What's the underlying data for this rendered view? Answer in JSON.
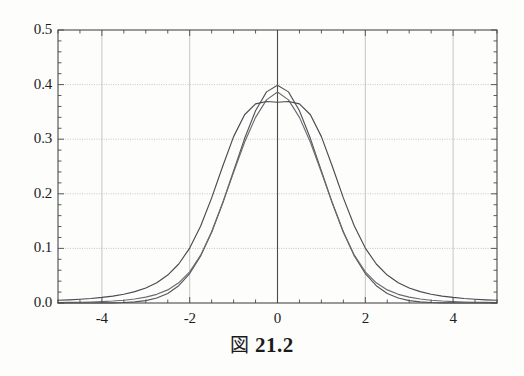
{
  "caption": {
    "figure_word": "図",
    "number": "21.2"
  },
  "chart_data": {
    "type": "line",
    "title": "",
    "xlabel": "",
    "ylabel": "",
    "xlim": [
      -5,
      5
    ],
    "ylim": [
      0.0,
      0.5
    ],
    "grid": true,
    "legend_position": "none",
    "x_ticks": [
      -4,
      -2,
      0,
      2,
      4
    ],
    "x_tick_labels": [
      "-4",
      "-2",
      "0",
      "2",
      "4"
    ],
    "x_minor_tick_step": 0.5,
    "y_ticks": [
      0.0,
      0.1,
      0.2,
      0.3,
      0.4,
      0.5
    ],
    "y_tick_labels": [
      "0.0",
      "0.1",
      "0.2",
      "0.3",
      "0.4",
      "0.5"
    ],
    "y_minor_tick_step": 0.02,
    "x": [
      -5.0,
      -4.75,
      -4.5,
      -4.25,
      -4.0,
      -3.75,
      -3.5,
      -3.25,
      -3.0,
      -2.75,
      -2.5,
      -2.25,
      -2.0,
      -1.75,
      -1.5,
      -1.25,
      -1.0,
      -0.75,
      -0.5,
      -0.25,
      0.0,
      0.25,
      0.5,
      0.75,
      1.0,
      1.25,
      1.5,
      1.75,
      2.0,
      2.25,
      2.5,
      2.75,
      3.0,
      3.25,
      3.5,
      3.75,
      4.0,
      4.25,
      4.5,
      4.75,
      5.0
    ],
    "series": [
      {
        "name": "normal",
        "peak": 0.3989,
        "color": "#55555a",
        "values": [
          1.5e-06,
          5e-06,
          1.6e-05,
          4.65e-05,
          0.0001338,
          0.0003458,
          0.0008727,
          0.00203,
          0.0044318,
          0.0090936,
          0.0175283,
          0.031682,
          0.053991,
          0.0862773,
          0.1295176,
          0.1826491,
          0.2419707,
          0.3011374,
          0.3520653,
          0.3866681,
          0.3989423,
          0.3866681,
          0.3520653,
          0.3011374,
          0.2419707,
          0.1826491,
          0.1295176,
          0.0862773,
          0.053991,
          0.031682,
          0.0175283,
          0.0090936,
          0.0044318,
          0.00203,
          0.0008727,
          0.0003458,
          0.0001338,
          4.65e-05,
          1.6e-05,
          5e-06,
          1.5e-06
        ]
      },
      {
        "name": "t-distribution-high-df",
        "peak": 0.3866,
        "color": "#6a6a70",
        "values": [
          0.0008,
          0.00105,
          0.0014,
          0.0019,
          0.0026,
          0.0036,
          0.0051,
          0.0073,
          0.0107,
          0.0159,
          0.024,
          0.0369,
          0.057,
          0.0876,
          0.1305,
          0.183,
          0.2395,
          0.2945,
          0.34,
          0.372,
          0.3866,
          0.372,
          0.34,
          0.2945,
          0.2395,
          0.183,
          0.1305,
          0.0876,
          0.057,
          0.0369,
          0.024,
          0.0159,
          0.0107,
          0.0073,
          0.0051,
          0.0036,
          0.0026,
          0.0019,
          0.0014,
          0.00105,
          0.0008
        ]
      },
      {
        "name": "t-distribution-low-df",
        "peak": 0.3676,
        "color": "#4a4a50",
        "values": [
          0.005,
          0.0058,
          0.0069,
          0.0083,
          0.0102,
          0.0127,
          0.0161,
          0.0209,
          0.0276,
          0.0372,
          0.0512,
          0.0714,
          0.1006,
          0.141,
          0.1925,
          0.25,
          0.3047,
          0.3448,
          0.3647,
          0.369,
          0.3676,
          0.369,
          0.3647,
          0.3448,
          0.3047,
          0.25,
          0.1925,
          0.141,
          0.1006,
          0.0714,
          0.0512,
          0.0372,
          0.0276,
          0.0209,
          0.0161,
          0.0127,
          0.0102,
          0.0083,
          0.0069,
          0.0058,
          0.005
        ]
      }
    ]
  },
  "style": {
    "frame_color": "#4a4a4a",
    "grid_color": "#b8b8b8",
    "axis_line_color": "#4a4a4a",
    "background": "#fdfdfc",
    "text_color": "#1c1c1c"
  }
}
